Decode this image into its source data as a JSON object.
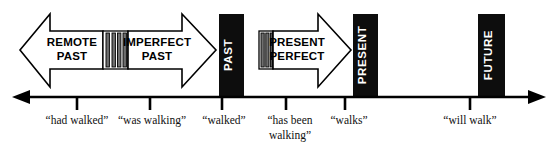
{
  "diagram": {
    "colors": {
      "solid_block": "#0d0d0d",
      "outline": "#000000",
      "background": "#ffffff",
      "stripe": "#6f6f6f",
      "block_text": "#ffffff",
      "arrow_text": "#000000"
    },
    "arrows": [
      {
        "id": "remote-past",
        "label_line1": "REMOTE",
        "label_line2": "PAST",
        "direction": "left",
        "style": "outline"
      },
      {
        "id": "imperfect-past",
        "label_line1": "IMPERFECT",
        "label_line2": "PAST",
        "direction": "right",
        "style": "outline"
      },
      {
        "id": "present-perfect",
        "label_line1": "PRESENT",
        "label_line2": "PERFECT",
        "direction": "right",
        "style": "outline"
      }
    ],
    "blocks": [
      {
        "id": "past",
        "label": "PAST",
        "style": "solid",
        "orientation": "vertical"
      },
      {
        "id": "present",
        "label": "PRESENT",
        "style": "solid",
        "orientation": "vertical"
      },
      {
        "id": "future",
        "label": "FUTURE",
        "style": "solid",
        "orientation": "vertical"
      }
    ],
    "dividers": [
      {
        "id": "divider-past",
        "bars": 4
      },
      {
        "id": "divider-present-perfect",
        "bars": 3
      }
    ],
    "axis": {
      "left_arrowhead": true,
      "right_arrowhead": true,
      "ticks": [
        {
          "id": "tick-had-walked",
          "label": "“had walked”",
          "label_line2": ""
        },
        {
          "id": "tick-was-walking",
          "label": "“was walking”",
          "label_line2": ""
        },
        {
          "id": "tick-walked",
          "label": "“walked”",
          "label_line2": ""
        },
        {
          "id": "tick-has-been-walking",
          "label": "“has been",
          "label_line2": "walking”"
        },
        {
          "id": "tick-walks",
          "label": "“walks”",
          "label_line2": ""
        },
        {
          "id": "tick-will-walk",
          "label": "“will walk”",
          "label_line2": ""
        }
      ]
    }
  }
}
